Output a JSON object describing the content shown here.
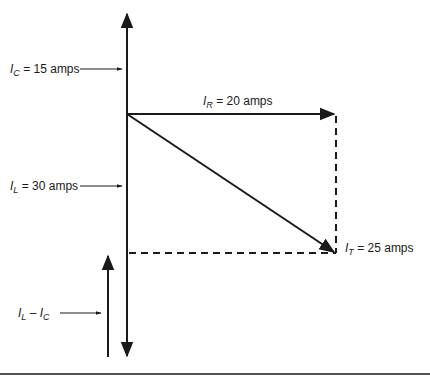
{
  "diagram": {
    "type": "phasor diagram",
    "labels": {
      "ic": {
        "symbol": "I",
        "subscript": "C",
        "text": " = 15 amps"
      },
      "il": {
        "symbol": "I",
        "subscript": "L",
        "text": " = 30 amps"
      },
      "ir": {
        "symbol": "I",
        "subscript": "R",
        "text": " = 20 amps"
      },
      "it": {
        "symbol": "I",
        "subscript": "T",
        "text": " = 25 amps"
      },
      "diff": {
        "symbol1": "I",
        "subscript1": "L",
        "minus": " – ",
        "symbol2": "I",
        "subscript2": "C"
      }
    },
    "colors": {
      "line": "#1a1a1a",
      "background": "#ffffff"
    }
  }
}
